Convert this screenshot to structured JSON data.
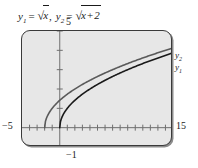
{
  "caption": {
    "expr1": {
      "var": "y",
      "sub": "1",
      "eq": "=",
      "radicand": "x"
    },
    "separator": ",",
    "expr2": {
      "var": "y",
      "sub": "2",
      "eq": "=",
      "radicand_left": "x",
      "radicand_op": "+",
      "radicand_right": "2"
    }
  },
  "axis_labels": {
    "ymax": "5",
    "ymin": "−1",
    "xmin": "−5",
    "xmax": "15"
  },
  "curve_labels": {
    "upper": {
      "var": "y",
      "sub": "2"
    },
    "lower": {
      "var": "y",
      "sub": "1"
    }
  },
  "colors": {
    "plot_background": "#e7e7e7",
    "frame_border": "#3a3a3a",
    "axis": "#6f6f6f",
    "curve_y1": "#1a1a1a",
    "curve_y2": "#5a5a5a",
    "text": "#1a1a1a"
  },
  "chart_data": {
    "type": "line",
    "xlabel": "",
    "ylabel": "",
    "xlim": [
      -5,
      15
    ],
    "ylim": [
      -1,
      5
    ],
    "xticks": [
      -4,
      -3,
      -2,
      -1,
      0,
      1,
      2,
      3,
      4,
      5,
      6,
      7,
      8,
      9,
      10,
      11,
      12,
      13,
      14
    ],
    "yticks": [
      0,
      1,
      2,
      3,
      4,
      5
    ],
    "grid": false,
    "legend_position": "right-outside",
    "series": [
      {
        "name": "y1",
        "label": "y1",
        "expression": "sqrt(x)",
        "color": "#1a1a1a",
        "domain_start": 0,
        "x": [
          0,
          0.25,
          0.5,
          1,
          1.5,
          2,
          3,
          4,
          5,
          6,
          7,
          8,
          9,
          10,
          11,
          12,
          13,
          14,
          15
        ],
        "y": [
          0,
          0.5,
          0.707,
          1,
          1.225,
          1.414,
          1.732,
          2,
          2.236,
          2.449,
          2.646,
          2.828,
          3,
          3.162,
          3.317,
          3.464,
          3.606,
          3.742,
          3.873
        ]
      },
      {
        "name": "y2",
        "label": "y2",
        "expression": "sqrt(x + 2)",
        "color": "#5a5a5a",
        "domain_start": -2,
        "x": [
          -2,
          -1.75,
          -1.5,
          -1,
          -0.5,
          0,
          1,
          2,
          3,
          4,
          5,
          6,
          7,
          8,
          9,
          10,
          11,
          12,
          13,
          14,
          15
        ],
        "y": [
          0,
          0.5,
          0.707,
          1,
          1.225,
          1.414,
          1.732,
          2,
          2.236,
          2.449,
          2.646,
          2.828,
          3,
          3.162,
          3.317,
          3.464,
          3.606,
          3.742,
          3.873,
          4,
          4.123
        ]
      }
    ]
  }
}
